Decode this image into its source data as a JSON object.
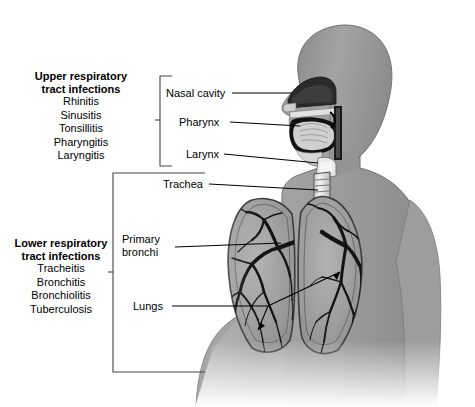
{
  "figure": {
    "background": "#ffffff",
    "body_gray": "#9a9a9a",
    "line_color": "#000000"
  },
  "groups": [
    {
      "id": "upper",
      "heading_line1": "Upper respiratory",
      "heading_line2": "tract infections",
      "items": [
        "Rhinitis",
        "Sinusitis",
        "Tonsillitis",
        "Pharyngitis",
        "Laryngitis"
      ]
    },
    {
      "id": "lower",
      "heading_line1": "Lower respiratory",
      "heading_line2": "tract infections",
      "items": [
        "Tracheitis",
        "Bronchitis",
        "Bronchiolitis",
        "Tuberculosis"
      ]
    }
  ],
  "callouts": [
    {
      "id": "nasal-cavity",
      "label": "Nasal cavity"
    },
    {
      "id": "pharynx",
      "label": "Pharynx"
    },
    {
      "id": "larynx",
      "label": "Larynx"
    },
    {
      "id": "trachea",
      "label": "Trachea"
    },
    {
      "id": "primary-bronchi",
      "label_line1": "Primary",
      "label_line2": "bronchi"
    },
    {
      "id": "lungs",
      "label": "Lungs"
    }
  ]
}
